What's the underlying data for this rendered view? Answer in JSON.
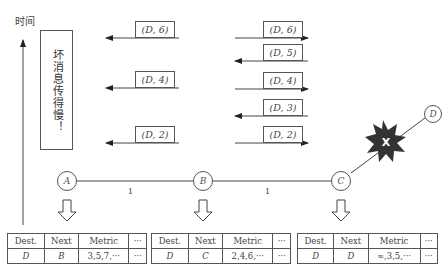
{
  "axis": {
    "label": "时间"
  },
  "annotation": {
    "text": "坏消息传得慢！"
  },
  "messages": {
    "a_side": [
      {
        "label": "(D, 6)",
        "direction": "left"
      },
      {
        "label": "(D, 4)",
        "direction": "left"
      },
      {
        "label": "(D, 2)",
        "direction": "left"
      }
    ],
    "b_side": [
      {
        "label": "(D, 6)",
        "direction": "right"
      },
      {
        "label": "(D, 5)",
        "direction": "left"
      },
      {
        "label": "(D, 4)",
        "direction": "right"
      },
      {
        "label": "(D, 3)",
        "direction": "left"
      },
      {
        "label": "(D, 2)",
        "direction": "right"
      }
    ]
  },
  "nodes": [
    {
      "id": "A"
    },
    {
      "id": "B"
    },
    {
      "id": "C"
    },
    {
      "id": "D"
    }
  ],
  "links": [
    {
      "from": "A",
      "to": "B",
      "weight": "1"
    },
    {
      "from": "B",
      "to": "C",
      "weight": "1"
    },
    {
      "from": "C",
      "to": "D",
      "state": "broken",
      "marker": "X"
    }
  ],
  "tables": {
    "headers": [
      "Dest.",
      "Next",
      "Metric",
      "···"
    ],
    "A": {
      "dest": "D",
      "next": "B",
      "metric": "3,5,7,···",
      "more": "···"
    },
    "B": {
      "dest": "D",
      "next": "C",
      "metric": "2,4,6,···",
      "more": "···"
    },
    "C": {
      "dest": "D",
      "next": "D",
      "metric": "∞,3,5,···",
      "more": "···"
    }
  }
}
